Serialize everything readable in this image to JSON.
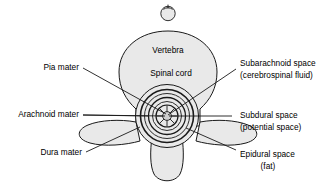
{
  "figure": {
    "background_color": "#ffffff",
    "fill_color": "#e9e9e9",
    "stroke_color": "#1a1a1a"
  },
  "inner_labels": [
    {
      "id": "vertebra",
      "text": "Vertebra"
    },
    {
      "id": "spinal-cord",
      "text": "Spinal cord"
    }
  ],
  "left_labels": [
    {
      "id": "pia-mater",
      "text": "Pia mater"
    },
    {
      "id": "arachnoid-mater",
      "text": "Arachnoid mater"
    },
    {
      "id": "dura-mater",
      "text": "Dura mater"
    }
  ],
  "right_labels": [
    {
      "id": "subarachnoid-space",
      "line1": "Subarachnoid space",
      "line2": "(cerebrospinal fluid)"
    },
    {
      "id": "subdural-space",
      "line1": "Subdural space",
      "line2": "(potential space)"
    },
    {
      "id": "epidural-space",
      "line1": "Epidural space",
      "line2": "(fat)"
    }
  ]
}
